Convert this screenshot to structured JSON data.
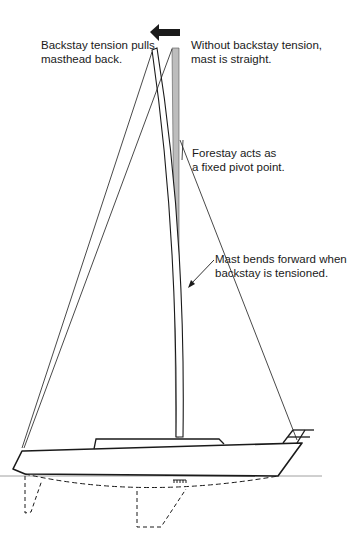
{
  "diagram": {
    "colors": {
      "line": "#1a1a1a",
      "straight_mast_fill": "#bdbdbd",
      "background": "#ffffff"
    },
    "icons": {
      "direction_arrow": "left-arrow-icon",
      "callout_arrow": "pointer-arrow-icon",
      "mast_step": "mast-step-icon",
      "bow_pulpit": "pulpit-rail-icon"
    },
    "labels": {
      "backstay_tension": {
        "line1": "Backstay tension pulls",
        "line2": "masthead back."
      },
      "without_tension": {
        "line1": "Without backstay tension,",
        "line2": "mast is straight."
      },
      "forestay_pivot": {
        "line1": "Forestay acts as",
        "line2": "a fixed pivot point."
      },
      "mast_bends": {
        "line1": "Mast bends forward when",
        "line2": "backstay is tensioned."
      }
    },
    "components": [
      "straight mast (gray)",
      "bent mast (white outline)",
      "backstay (two positions)",
      "forestay",
      "hull",
      "cabin",
      "bow pulpit",
      "waterline",
      "keel (dashed, underwater)",
      "rudder (dashed, underwater)"
    ]
  }
}
